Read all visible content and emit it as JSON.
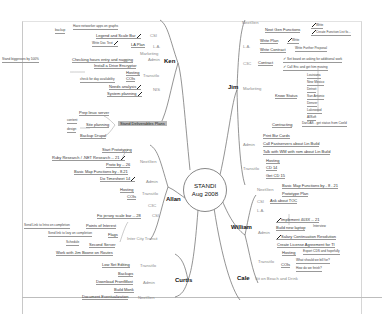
{
  "center": {
    "line1": "STANDI",
    "line2": "Aug 2008"
  },
  "ken": {
    "label": "Ken",
    "backup_note": "Have networker apps on graphs",
    "backup": "backup",
    "csi": "CSI",
    "legend": "Legend and Scale Bar",
    "la": "L.A.",
    "la_plan": "LA Plan",
    "write_doc": "Write Doc Text",
    "marketing": "Marketing",
    "admin": "Admin",
    "checking": "Checking hours entry and nagging",
    "checking_note": "Stand biggesses by 100%",
    "install": "Install a Drive Encryptor",
    "transito": "TransitIo",
    "hosting": "Hosting",
    "cois": "COIs",
    "check_day": "check for day availability",
    "nis": "NIS",
    "needs": "Needs analysis",
    "system": "System planning",
    "prep": "Prep linux server",
    "site_planning": "Site planning",
    "content": "content",
    "design": "design",
    "backup_drupal": "Backup Drupal",
    "highlight": "Stand Deliverables Plans"
  },
  "allan": {
    "label": "Allan",
    "nextgen": "NextGen",
    "start_proto": "Start Prototyping",
    "ruby": "Ruby Research / .NET Research -- 21",
    "proto": "Proto by -- 26",
    "basic_map": "Basic Map Functions by - 8.21",
    "admin": "Admin",
    "timesheet": "Do Timesheet 14",
    "transito": "TransitIo",
    "hosting": "Hosting",
    "cois": "COIs",
    "c3c": "C3C",
    "csi": "CSI",
    "fix_jersey": "Fix jersey scale bar -- 28",
    "intercity": "Inter City Transit",
    "poi": "Points of Interest",
    "poi_note": "Send Link to Intro on completion",
    "flags": "Flags",
    "flags_note": "Send link to Izzy on completion",
    "second_server": "Second Server",
    "schedule": "Schedule",
    "work_jim": "Work with Jim Boone on Routes"
  },
  "curtis": {
    "label": "Curtis",
    "transito": "TransitIo",
    "low_set": "Low Set Editing",
    "admin": "Admin",
    "backups": "Backups",
    "download": "Download FrontMost",
    "build_mon": "Build Monk",
    "nextgen": "NextGen",
    "document": "Document Eventualization"
  },
  "jim": {
    "label": "Jim",
    "nextgen": "NextGen",
    "next_gen_func": "Next Gen Functions",
    "write": "Write",
    "create_func": "Create Function List fo...",
    "la": "L.A.",
    "write_plan": "Write Plan",
    "write2": "Write",
    "write_contract": "Write Contract",
    "write_further": "Write Further Proposal",
    "c3c": "C3C",
    "contract": "Contract",
    "contract1": "Set board on asking for additional work",
    "contract2": "Call Eric and get him moving",
    "marketing": "Marketing",
    "know_status": "Know Status",
    "cities": [
      "Louisiana",
      "New Mexico",
      "Detroit",
      "San Antonio",
      "Denver",
      "Lakewood",
      "AllSoft"
    ],
    "contracting": "Contracting",
    "contracting_note": "DarDAS - get status from Coeld",
    "admin": "Admin",
    "print_cards": "Print Biz Cards",
    "call_fast": "Call Fastservers about Lin Build",
    "talk_wm": "Talk with WM with rom about Lin Build",
    "transito": "TransitIo",
    "hosting": "Hosting",
    "cd14": "CD 14",
    "get_cd": "Get CD 15"
  },
  "william": {
    "label": "William",
    "nextgen": "NextGen",
    "basic_map": "Basic Map Functions by - 8 . 21",
    "prototype": "Prototype Plan",
    "csi": "CSI",
    "ask_toc": "Ask about TOC",
    "la": "L.A.",
    "admin": "Admin",
    "implement": "Implement 403X -- 21",
    "build_laptop": "Build new laptop",
    "laptop_note": "Interview",
    "salary": "Salary Continuation Resolution",
    "license": "Create License Agreement for TI",
    "transito": "TransitIo",
    "hosting": "Hosting",
    "hosting_note": "Export CDS and hopefully",
    "cois": "COIs",
    "cois1": "What should we bill for?",
    "cois2": "How do we finish?"
  },
  "cale": {
    "label": "Cale",
    "note": "Sit on Beach and Drink"
  }
}
